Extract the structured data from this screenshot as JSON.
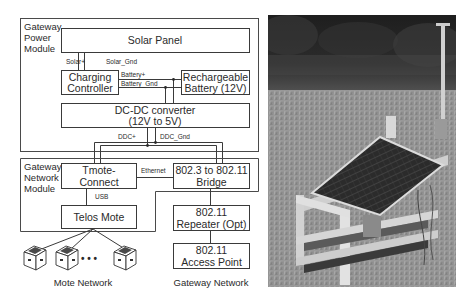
{
  "diagram": {
    "power_module": {
      "label_lines": [
        "Gateway",
        "Power",
        "Module"
      ],
      "solar_panel": "Solar Panel",
      "charging_controller": [
        "Charging",
        "Controller"
      ],
      "battery": [
        "Rechargeable",
        "Battery (12V)"
      ],
      "dcdc": [
        "DC-DC converter",
        "(12V to 5V)"
      ],
      "wires": {
        "solar_plus": "Solar+",
        "solar_gnd": "Solar_Gnd",
        "battery_plus": "Battery+",
        "battery_gnd": "Battery_Gnd",
        "ddc_plus": "DDC+",
        "ddc_gnd": "DDC_Gnd"
      }
    },
    "network_module": {
      "label_lines": [
        "Gateway",
        "Network",
        "Module"
      ],
      "tmote_connect": [
        "Tmote-",
        "Connect"
      ],
      "bridge": [
        "802.3 to 802.11",
        "Bridge"
      ],
      "telos_mote": "Telos Mote",
      "wires": {
        "ethernet": "Ethernet",
        "usb": "USB"
      }
    },
    "repeater": [
      "802.11",
      "Repeater (Opt)"
    ],
    "access_point": [
      "802.11",
      "Access Point"
    ],
    "motes": {
      "ellipsis": "• • •",
      "count_shown": 3
    },
    "captions": {
      "mote_network": "Mote Network",
      "gateway_network": "Gateway Network"
    },
    "colors": {
      "line": "#3a3a3a",
      "background": "#ffffff",
      "mote_top": "#555555"
    }
  },
  "photo": {
    "subject": "solar-powered-gateway-field-deployment",
    "description": "Grayscale photo of a wooden stand with a tilted solar panel, enclosure shelves and a mast antenna on a grassy field"
  }
}
